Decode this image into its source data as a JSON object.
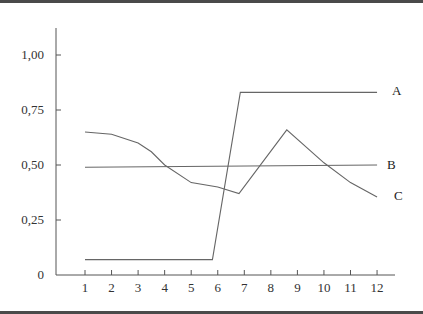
{
  "chart_data": {
    "type": "line",
    "title": "",
    "xlabel": "",
    "ylabel": "",
    "x_ticks": [
      "1",
      "2",
      "3",
      "4",
      "5",
      "6",
      "7",
      "8",
      "9",
      "10",
      "11",
      "12"
    ],
    "y_ticks": [
      "0",
      "0,25",
      "0,50",
      "0,75",
      "1,00"
    ],
    "xlim": [
      0.5,
      13.2
    ],
    "ylim": [
      0,
      1.0
    ],
    "grid": false,
    "legend": "inline labels at right end of each line",
    "series": [
      {
        "name": "A",
        "x": [
          1,
          5.8,
          6.85,
          12
        ],
        "values": [
          0.07,
          0.07,
          0.83,
          0.83
        ]
      },
      {
        "name": "B",
        "x": [
          1,
          12
        ],
        "values": [
          0.49,
          0.5
        ]
      },
      {
        "name": "C",
        "x": [
          1,
          2,
          3,
          3.5,
          4,
          5,
          6,
          6.8,
          8.6,
          10,
          11,
          12
        ],
        "values": [
          0.65,
          0.64,
          0.6,
          0.56,
          0.5,
          0.42,
          0.4,
          0.37,
          0.66,
          0.51,
          0.42,
          0.355
        ]
      }
    ]
  },
  "labels": {
    "y": [
      "0",
      "0,25",
      "0,50",
      "0,75",
      "1,00"
    ],
    "x": [
      "1",
      "2",
      "3",
      "4",
      "5",
      "6",
      "7",
      "8",
      "9",
      "10",
      "11",
      "12"
    ],
    "series": [
      "A",
      "B",
      "C"
    ]
  }
}
